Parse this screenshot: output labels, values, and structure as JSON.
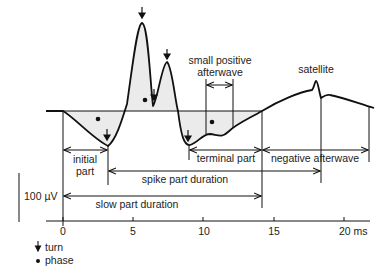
{
  "figure": {
    "type": "motor unit action potential schematic",
    "labels": {
      "small_positive_afterwave_line1": "small positive",
      "small_positive_afterwave_line2": "afterwave",
      "satellite": "satellite",
      "initial_part_line1": "initial",
      "initial_part_line2": "part",
      "terminal_part": "terminal part",
      "negative_afterwave": "negative afterwave",
      "spike_part_duration": "spike part duration",
      "slow_part_duration": "slow part duration"
    },
    "scale_bar": {
      "label": "100 µV"
    },
    "time_axis": {
      "ticks": [
        "0",
        "5",
        "10",
        "15",
        "20 ms"
      ],
      "unit": "ms"
    },
    "legend": {
      "items": [
        {
          "icon": "down-arrow-icon",
          "label": "turn"
        },
        {
          "icon": "dot-icon",
          "label": "phase"
        }
      ]
    },
    "colors": {
      "line": "#111111",
      "fill": "#ebebeb",
      "background": "#ffffff"
    }
  }
}
